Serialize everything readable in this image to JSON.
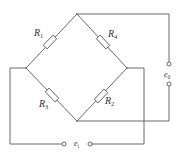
{
  "diagram": {
    "type": "Wheatstone bridge circuit",
    "colors": {
      "wire": "#5a5a5a",
      "text": "#333333",
      "background": "#ffffff"
    },
    "resistors": [
      {
        "id": "R1",
        "label": "R",
        "subscript": "1",
        "position": "top-left arm"
      },
      {
        "id": "R4",
        "label": "R",
        "subscript": "4",
        "position": "top-right arm"
      },
      {
        "id": "R3",
        "label": "R",
        "subscript": "3",
        "position": "bottom-left arm"
      },
      {
        "id": "R2",
        "label": "R",
        "subscript": "2",
        "position": "bottom-right arm"
      }
    ],
    "terminals": {
      "output": {
        "label": "e",
        "subscript": "0",
        "position": "right side, between top and bottom nodes"
      },
      "input": {
        "label": "e",
        "subscript": "i",
        "position": "bottom, between left and right nodes"
      }
    }
  }
}
